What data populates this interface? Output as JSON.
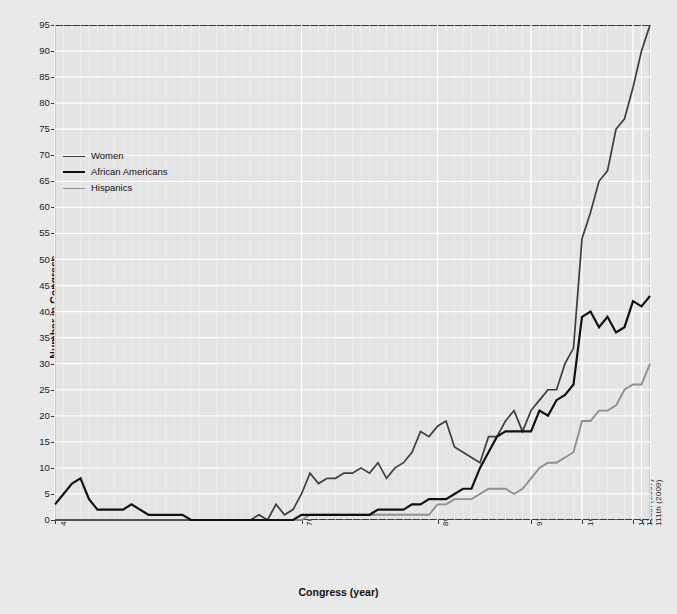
{
  "chart_data": {
    "type": "line",
    "title": "",
    "xlabel": "Congress (year)",
    "ylabel": "Number in Congress",
    "ylim": [
      0,
      95
    ],
    "yticks": [
      0,
      5,
      10,
      15,
      20,
      25,
      30,
      35,
      40,
      45,
      50,
      55,
      60,
      65,
      70,
      75,
      80,
      85,
      90,
      95
    ],
    "grid": true,
    "legend_position": "upper-left",
    "x_tick_labels": [
      "41st (1869)",
      "70th (1927)",
      "86th (1959)",
      "97th (1981)",
      "103d (1993)",
      "109th (2005)",
      "110th (2007)",
      "111th (2009)"
    ],
    "x_tick_congress": [
      41,
      70,
      86,
      97,
      103,
      109,
      110,
      111
    ],
    "x_range_congress": [
      41,
      111
    ],
    "x": [
      41,
      42,
      43,
      44,
      45,
      46,
      47,
      48,
      49,
      50,
      51,
      52,
      53,
      54,
      55,
      56,
      57,
      58,
      59,
      60,
      61,
      62,
      63,
      64,
      65,
      66,
      67,
      68,
      69,
      70,
      71,
      72,
      73,
      74,
      75,
      76,
      77,
      78,
      79,
      80,
      81,
      82,
      83,
      84,
      85,
      86,
      87,
      88,
      89,
      90,
      91,
      92,
      93,
      94,
      95,
      96,
      97,
      98,
      99,
      100,
      101,
      102,
      103,
      104,
      105,
      106,
      107,
      108,
      109,
      110,
      111
    ],
    "series": [
      {
        "name": "Women",
        "color": "#3d3d3d",
        "values": [
          0,
          0,
          0,
          0,
          0,
          0,
          0,
          0,
          0,
          0,
          0,
          0,
          0,
          0,
          0,
          0,
          0,
          0,
          0,
          0,
          0,
          0,
          0,
          0,
          1,
          0,
          3,
          1,
          2,
          5,
          9,
          7,
          8,
          8,
          9,
          9,
          10,
          9,
          11,
          8,
          10,
          11,
          13,
          17,
          16,
          18,
          19,
          14,
          13,
          12,
          11,
          16,
          16,
          19,
          21,
          17,
          21,
          23,
          25,
          25,
          30,
          33,
          54,
          59,
          65,
          67,
          75,
          77,
          83,
          90,
          95
        ]
      },
      {
        "name": "African Americans",
        "color": "#111111",
        "values": [
          3,
          5,
          7,
          8,
          4,
          2,
          2,
          2,
          2,
          3,
          2,
          1,
          1,
          1,
          1,
          1,
          0,
          0,
          0,
          0,
          0,
          0,
          0,
          0,
          0,
          0,
          0,
          0,
          0,
          1,
          1,
          1,
          1,
          1,
          1,
          1,
          1,
          1,
          2,
          2,
          2,
          2,
          3,
          3,
          4,
          4,
          4,
          5,
          6,
          6,
          10,
          13,
          16,
          17,
          17,
          17,
          17,
          21,
          20,
          23,
          24,
          26,
          39,
          40,
          37,
          39,
          36,
          37,
          42,
          41,
          43
        ]
      },
      {
        "name": "Hispanics",
        "color": "#8f8f8f",
        "values": [
          0,
          0,
          0,
          0,
          0,
          0,
          0,
          0,
          0,
          0,
          0,
          0,
          0,
          0,
          0,
          0,
          0,
          0,
          0,
          0,
          0,
          0,
          0,
          0,
          0,
          0,
          0,
          0,
          0,
          0,
          1,
          1,
          1,
          1,
          1,
          1,
          1,
          1,
          1,
          1,
          1,
          1,
          1,
          1,
          1,
          3,
          3,
          4,
          4,
          4,
          5,
          6,
          6,
          6,
          5,
          6,
          8,
          10,
          11,
          11,
          12,
          13,
          19,
          19,
          21,
          21,
          22,
          25,
          26,
          26,
          30
        ]
      }
    ]
  },
  "axes": {
    "ytitle": "Number in Congress",
    "xtitle": "Congress (year)"
  },
  "legend": {
    "entries": [
      {
        "label": "Women",
        "color": "#3d3d3d",
        "weight": "1.6px"
      },
      {
        "label": "African Americans",
        "color": "#111111",
        "weight": "2.4px"
      },
      {
        "label": "Hispanics",
        "color": "#8f8f8f",
        "weight": "1.8px"
      }
    ]
  }
}
